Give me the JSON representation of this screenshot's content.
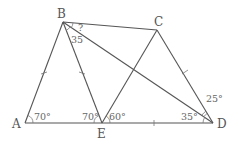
{
  "figure": {
    "type": "geometry-quadrilateral",
    "vertices": {
      "A": {
        "label": "A",
        "x": 25,
        "y": 123
      },
      "B": {
        "label": "B",
        "x": 63,
        "y": 22
      },
      "C": {
        "label": "C",
        "x": 157,
        "y": 30
      },
      "D": {
        "label": "D",
        "x": 213,
        "y": 123
      },
      "E": {
        "label": "E",
        "x": 102,
        "y": 123
      }
    },
    "segments": [
      "AB",
      "BC",
      "CD",
      "AD",
      "BE",
      "CE",
      "BD"
    ],
    "equal_length_ticks": [
      "AB",
      "BE",
      "ED",
      "CD"
    ],
    "angles": {
      "A": "70°",
      "BEA": "70°",
      "CED": "60°",
      "BDA": "35°",
      "CDB": "25°",
      "EBD": "35",
      "CBD": "?"
    },
    "stroke_color": "#555555",
    "background": "#ffffff"
  }
}
